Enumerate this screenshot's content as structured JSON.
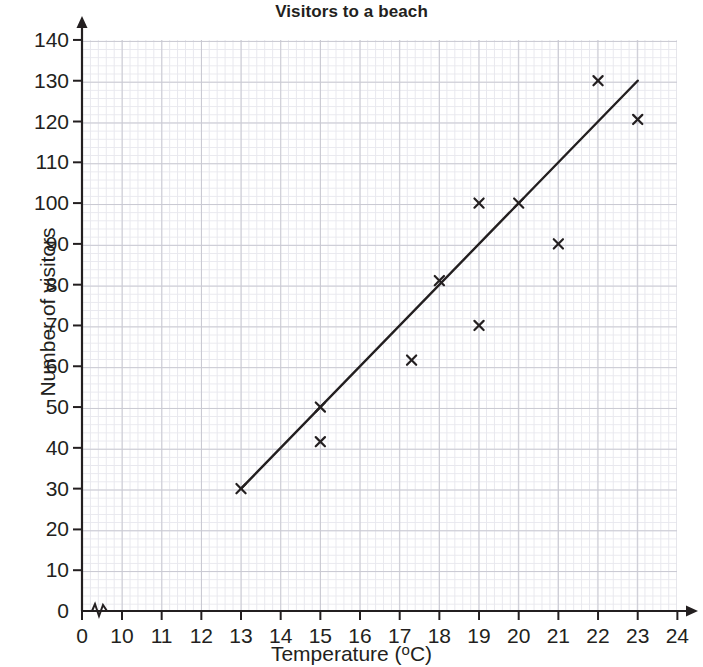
{
  "chart_data": {
    "type": "scatter",
    "title": "Visitors to a beach",
    "xlabel": "Temperature (°C)",
    "ylabel": "Number of visitors",
    "xlim": [
      10,
      24
    ],
    "ylim": [
      0,
      140
    ],
    "x_axis_break": true,
    "x_break_label": "0",
    "xticks": [
      0,
      10,
      11,
      12,
      13,
      14,
      15,
      16,
      17,
      18,
      19,
      20,
      21,
      22,
      23,
      24
    ],
    "yticks": [
      0,
      10,
      20,
      30,
      40,
      50,
      60,
      70,
      80,
      90,
      100,
      110,
      120,
      130,
      140
    ],
    "grid": true,
    "grid_minor": true,
    "legend": null,
    "marker": "x",
    "marker_color": "#231f20",
    "points": [
      {
        "x": 13,
        "y": 30
      },
      {
        "x": 15,
        "y": 50
      },
      {
        "x": 15,
        "y": 41.5
      },
      {
        "x": 17.3,
        "y": 61.5
      },
      {
        "x": 18,
        "y": 81
      },
      {
        "x": 19,
        "y": 100
      },
      {
        "x": 19,
        "y": 70
      },
      {
        "x": 20,
        "y": 100
      },
      {
        "x": 21,
        "y": 90
      },
      {
        "x": 22,
        "y": 130
      },
      {
        "x": 23,
        "y": 120.5
      }
    ],
    "trend_line": {
      "name": "line of best fit",
      "start": {
        "x": 13,
        "y": 30
      },
      "end": {
        "x": 23,
        "y": 130
      },
      "color": "#231f20"
    }
  },
  "colors": {
    "ink": "#231f20",
    "grid_major": "#c9c9d2",
    "grid_minor": "#e8e8ee",
    "background": "#ffffff"
  },
  "axis_labels": {
    "x_name": "Temperature (",
    "x_name_deg": "o",
    "x_name_unit": "C)",
    "y_name": "Number of visitors"
  }
}
